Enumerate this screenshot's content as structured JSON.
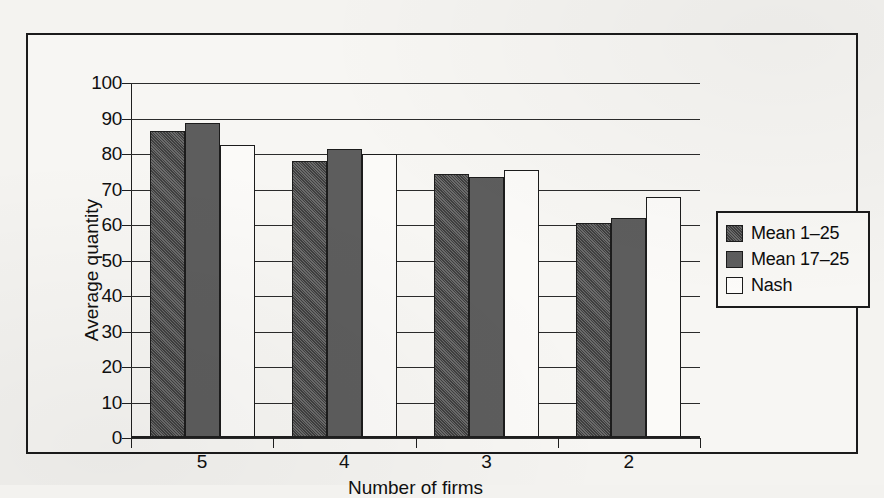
{
  "chart_data": {
    "type": "bar",
    "title": "",
    "xlabel": "Number of firms",
    "ylabel": "Average quantity",
    "categories": [
      "5",
      "4",
      "3",
      "2"
    ],
    "series": [
      {
        "name": "Mean 1–25",
        "values": [
          86.5,
          78.0,
          74.5,
          60.5
        ],
        "color": "#565656",
        "fill": "dither-dark"
      },
      {
        "name": "Mean 17–25",
        "values": [
          88.7,
          81.5,
          73.5,
          62.0
        ],
        "color": "#5d5d5d",
        "fill": "solid-gray"
      },
      {
        "name": "Nash",
        "values": [
          82.5,
          80.0,
          75.5,
          68.0
        ],
        "color": "#fbfaf8",
        "fill": "white"
      }
    ],
    "ylim": [
      0,
      100
    ],
    "ytick_step": 10,
    "yticks": [
      "100",
      "90",
      "80",
      "70",
      "60",
      "50",
      "40",
      "30",
      "20",
      "10",
      "0"
    ],
    "grid": true,
    "grid_axis": "y",
    "legend_position": "right-outside"
  },
  "axes": {
    "y_title": "Average quantity",
    "x_title": "Number of firms",
    "y_tick_labels": [
      "100",
      "90",
      "80",
      "70",
      "60",
      "50",
      "40",
      "30",
      "20",
      "10",
      "0"
    ],
    "x_tick_labels": [
      "5",
      "4",
      "3",
      "2"
    ]
  },
  "legend": {
    "items": [
      {
        "label": "Mean 1–25",
        "swatch": "dither-dark-swatch"
      },
      {
        "label": "Mean 17–25",
        "swatch": "solid-gray-swatch"
      },
      {
        "label": "Nash",
        "swatch": "white-swatch"
      }
    ]
  }
}
